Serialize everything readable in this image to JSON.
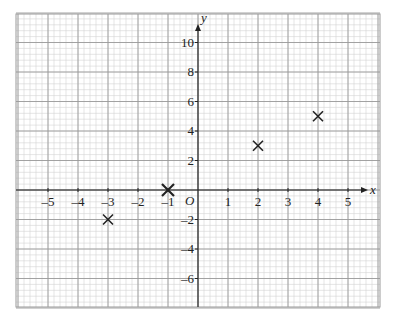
{
  "chart_data": {
    "type": "scatter",
    "title": "",
    "xlabel": "x",
    "ylabel": "y",
    "origin_label": "O",
    "xlim": [
      -6,
      6
    ],
    "ylim": [
      -8,
      12
    ],
    "grid": true,
    "x_ticks": [
      -5,
      -4,
      -3,
      -2,
      -1,
      1,
      2,
      3,
      4,
      5
    ],
    "x_tick_labels": [
      "–5",
      "–4",
      "–3",
      "–2",
      "–1",
      "1",
      "2",
      "3",
      "4",
      "5"
    ],
    "y_ticks": [
      10,
      8,
      6,
      4,
      2,
      -2,
      -4,
      -6
    ],
    "y_tick_labels": [
      "10",
      "8",
      "6",
      "4",
      "2",
      "–2",
      "–4",
      "–6"
    ],
    "series": [
      {
        "name": "points",
        "marker": "x",
        "x": [
          -3,
          -1,
          2,
          4
        ],
        "y": [
          -2,
          0,
          3,
          5
        ]
      }
    ],
    "colors": {
      "grid_minor": "#d4d4d4",
      "grid_major": "#9a9a9a",
      "axis": "#222222",
      "marker": "#222222"
    }
  }
}
